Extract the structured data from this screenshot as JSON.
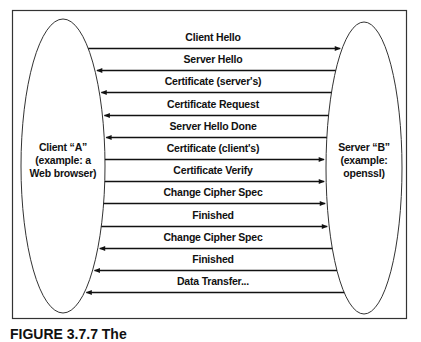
{
  "diagram": {
    "left_party": {
      "lines": [
        "Client “A”",
        "(example: a",
        "Web browser)"
      ]
    },
    "right_party": {
      "lines": [
        "Server “B”",
        "(example:",
        "openssl)"
      ]
    },
    "messages": [
      {
        "label": "Client Hello",
        "direction": "right"
      },
      {
        "label": "Server Hello",
        "direction": "left"
      },
      {
        "label": "Certificate (server's)",
        "direction": "left"
      },
      {
        "label": "Certificate Request",
        "direction": "left"
      },
      {
        "label": "Server Hello Done",
        "direction": "left"
      },
      {
        "label": "Certificate (client's)",
        "direction": "right"
      },
      {
        "label": "Certificate Verify",
        "direction": "right"
      },
      {
        "label": "Change Cipher Spec",
        "direction": "right"
      },
      {
        "label": "Finished",
        "direction": "right"
      },
      {
        "label": "Change Cipher Spec",
        "direction": "left"
      },
      {
        "label": "Finished",
        "direction": "left"
      },
      {
        "label": "Data Transfer...",
        "direction": "left"
      }
    ]
  },
  "caption": {
    "text": "FIGURE 3.7.7 The"
  },
  "colors": {
    "ink": "#111111",
    "background": "#ffffff"
  }
}
